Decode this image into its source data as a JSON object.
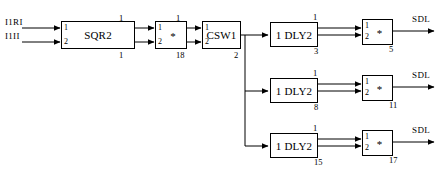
{
  "diagram": {
    "stroke_color": "#000000",
    "background_color": "#ffffff",
    "inputs": [
      {
        "label": "I1RI"
      },
      {
        "label": "I1II"
      }
    ],
    "outputs": [
      {
        "label": "SDL"
      },
      {
        "label": "SDL"
      },
      {
        "label": "SDL"
      }
    ],
    "blocks": [
      {
        "id": "sqr2",
        "label": "SQR2",
        "ports": [
          "1",
          "2"
        ]
      },
      {
        "id": "mul1",
        "label": "*",
        "ports": [
          "1",
          "2"
        ]
      },
      {
        "id": "csw1",
        "label": "CSW1",
        "ports": [
          "1",
          "2"
        ]
      },
      {
        "id": "dly2a",
        "label": "1 DLY2",
        "ports": []
      },
      {
        "id": "mul2",
        "label": "*",
        "ports": [
          "1",
          "2"
        ]
      },
      {
        "id": "dly2b",
        "label": "1 DLY2",
        "ports": []
      },
      {
        "id": "mul3",
        "label": "*",
        "ports": [
          "1",
          "2"
        ]
      },
      {
        "id": "dly2c",
        "label": "1 DLY2",
        "ports": []
      },
      {
        "id": "mul4",
        "label": "*",
        "ports": [
          "1",
          "2"
        ]
      }
    ],
    "signal_labels": {
      "sqr2_out_top": "1",
      "sqr2_out_bottom": "1",
      "mul1_in_top": "1",
      "mul1_out_bottom": "18",
      "mul1_out_top": "1",
      "csw1_out_bottom": "2",
      "dly2a_out_top": "1",
      "dly2a_out_bottom": "3",
      "mul2_out_bottom": "5",
      "dly2b_out_top": "1",
      "dly2b_out_bottom": "8",
      "mul3_out_bottom": "11",
      "dly2c_out_top": "1",
      "dly2c_out_bottom": "15",
      "mul4_out_bottom": "17"
    }
  }
}
